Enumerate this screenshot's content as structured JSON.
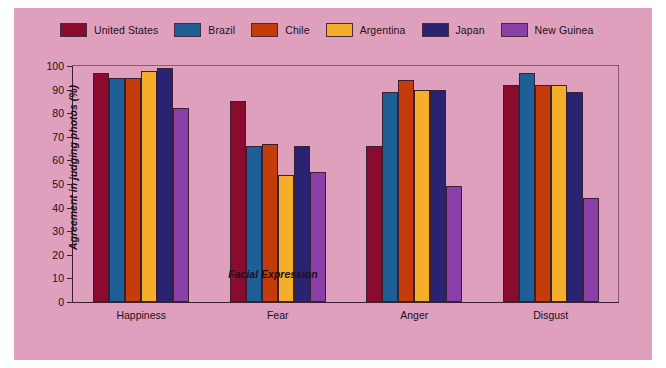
{
  "chart_data": {
    "type": "bar",
    "title": "",
    "xlabel": "Facial Expression",
    "ylabel": "Agreement in judging photos (%)",
    "categories": [
      "Happiness",
      "Fear",
      "Anger",
      "Disgust"
    ],
    "ylim": [
      0,
      100
    ],
    "yticks": [
      0,
      10,
      20,
      30,
      40,
      50,
      60,
      70,
      80,
      90,
      100
    ],
    "grid": false,
    "legend_position": "top",
    "series": [
      {
        "name": "United States",
        "color": "#8b0b2f",
        "values": [
          97,
          85,
          66,
          92
        ]
      },
      {
        "name": "Brazil",
        "color": "#1d5f96",
        "values": [
          95,
          66,
          89,
          97
        ]
      },
      {
        "name": "Chile",
        "color": "#c43c0a",
        "values": [
          95,
          67,
          94,
          92
        ]
      },
      {
        "name": "Argentina",
        "color": "#f5ae29",
        "values": [
          98,
          54,
          90,
          92
        ]
      },
      {
        "name": "Japan",
        "color": "#2a2272",
        "values": [
          99,
          66,
          90,
          89
        ]
      },
      {
        "name": "New Guinea",
        "color": "#8b3fa8",
        "values": [
          82,
          55,
          49,
          44
        ]
      }
    ]
  },
  "colors": {
    "background": "#dfa0bd",
    "page": "#ffffff",
    "axis": "#3a2030",
    "text": "#201018"
  }
}
